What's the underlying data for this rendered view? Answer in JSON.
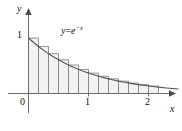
{
  "chart_data": {
    "type": "area",
    "title": "",
    "subtitle": "",
    "xlabel": "x",
    "ylabel": "y",
    "xlim": [
      0,
      2.55
    ],
    "ylim": [
      0,
      1.18
    ],
    "grid": false,
    "legend": null,
    "annotations": [
      {
        "name": "curve-equation",
        "text_parts": {
          "lhs": "y",
          "operator": "=",
          "base": "e",
          "exponent": "−x"
        },
        "text": "y = e^(−x)",
        "x": 0.55,
        "y": 1.0
      }
    ],
    "axes": {
      "x_ticks": [
        0,
        1,
        2
      ],
      "x_tick_labels": [
        "0",
        "1",
        "2"
      ],
      "y_ticks": [
        1
      ],
      "y_tick_labels": [
        "1"
      ],
      "origin_label": "0",
      "x_axis_arrow": true,
      "y_axis_arrow": true
    },
    "series": [
      {
        "name": "y = e^(-x)",
        "type": "line",
        "function": "exp(-x)",
        "color": "#555555",
        "x": [
          0,
          0.1,
          0.2,
          0.3,
          0.4,
          0.5,
          0.6,
          0.7,
          0.8,
          0.9,
          1.0,
          1.1,
          1.2,
          1.3,
          1.4,
          1.5,
          1.6,
          1.7,
          1.8,
          1.9,
          2.0,
          2.1,
          2.2,
          2.3,
          2.4,
          2.5
        ],
        "y": [
          1.0,
          0.905,
          0.819,
          0.741,
          0.67,
          0.607,
          0.549,
          0.497,
          0.449,
          0.407,
          0.368,
          0.333,
          0.301,
          0.273,
          0.247,
          0.223,
          0.202,
          0.183,
          0.165,
          0.15,
          0.135,
          0.122,
          0.111,
          0.1,
          0.091,
          0.082
        ]
      },
      {
        "name": "left-endpoint rectangles",
        "type": "bar",
        "rule": "left-endpoint",
        "bar_width": 0.1667,
        "fill": "#f2f2f2",
        "stroke": "#7d7d7d",
        "left_edges": [
          0,
          0.1667,
          0.3333,
          0.5,
          0.6667,
          0.8333,
          1.0,
          1.1667,
          1.3333,
          1.5,
          1.6667,
          1.8333,
          2.0
        ],
        "values": [
          1.0,
          0.8465,
          0.7165,
          0.6065,
          0.5134,
          0.4346,
          0.3679,
          0.3114,
          0.2636,
          0.2231,
          0.1889,
          0.1599,
          0.1353
        ]
      }
    ]
  }
}
